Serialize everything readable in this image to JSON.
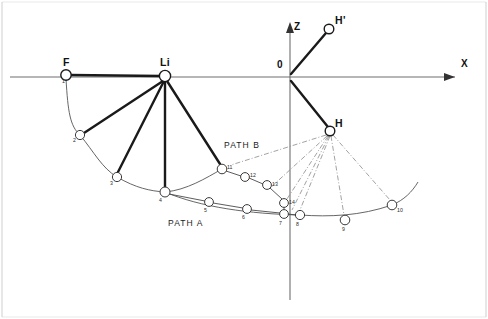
{
  "figure": {
    "background_color": "#ffffff",
    "width": 488,
    "height": 319
  },
  "axes": {
    "x_label": "X",
    "z_label": "Z",
    "origin_label": "0",
    "x_axis": {
      "y": 77,
      "x_start": 10,
      "x_end": 468
    },
    "z_axis": {
      "x": 290,
      "y_start": 22,
      "y_end": 300
    }
  },
  "atoms": [
    {
      "name": "F",
      "label": "F",
      "x": 66,
      "y": 75,
      "r": 5.2,
      "label_dx": -3,
      "label_dy": -18
    },
    {
      "name": "Li",
      "label": "Li",
      "x": 165,
      "y": 76,
      "r": 5.6,
      "label_dx": -5,
      "label_dy": -19
    },
    {
      "name": "H_prime",
      "label": "H'",
      "x": 329,
      "y": 29,
      "r": 4.8,
      "label_dx": 6,
      "label_dy": -14
    },
    {
      "name": "H",
      "label": "H",
      "x": 330,
      "y": 131,
      "r": 4.8,
      "label_dx": 5,
      "label_dy": -13
    }
  ],
  "bonds": [
    {
      "from": "F",
      "to": "Li",
      "style": "heavy"
    },
    {
      "from": "0",
      "to": "H_prime",
      "style": "heavy"
    },
    {
      "from": "0",
      "to": "H",
      "style": "heavy"
    }
  ],
  "li_rays": [
    {
      "to_point": 2
    },
    {
      "to_point": 3
    },
    {
      "to_point": 4
    },
    {
      "to_point": 11
    }
  ],
  "path_labels": [
    {
      "name": "path-a-label",
      "text": "PATH A",
      "x": 168,
      "y": 219
    },
    {
      "name": "path-b-label",
      "text": "PATH B",
      "x": 224,
      "y": 141
    }
  ],
  "trajectory_points": [
    {
      "id": 1,
      "label": "1",
      "x": 66,
      "y": 75,
      "r": 5.2,
      "path": "A",
      "label_dx": -4,
      "label_dy": 4
    },
    {
      "id": 2,
      "label": "2",
      "x": 80,
      "y": 135,
      "r": 4.6,
      "path": "A",
      "label_dx": -7,
      "label_dy": 3
    },
    {
      "id": 3,
      "label": "3",
      "x": 117,
      "y": 177,
      "r": 4.6,
      "path": "A",
      "label_dx": -7,
      "label_dy": 4
    },
    {
      "id": 4,
      "label": "4",
      "x": 165,
      "y": 192,
      "r": 5.0,
      "path": "A",
      "label_dx": -6,
      "label_dy": 6
    },
    {
      "id": 5,
      "label": "5",
      "x": 209,
      "y": 202,
      "r": 4.4,
      "path": "A",
      "label_dx": -5,
      "label_dy": 6
    },
    {
      "id": 6,
      "label": "6",
      "x": 247,
      "y": 209,
      "r": 4.4,
      "path": "A",
      "label_dx": -5,
      "label_dy": 6
    },
    {
      "id": 7,
      "label": "7",
      "x": 284,
      "y": 214,
      "r": 4.4,
      "path": "A",
      "label_dx": -5,
      "label_dy": 7
    },
    {
      "id": 8,
      "label": "8",
      "x": 300,
      "y": 215,
      "r": 4.6,
      "path": "A",
      "label_dx": -4,
      "label_dy": 7
    },
    {
      "id": 9,
      "label": "9",
      "x": 345,
      "y": 220,
      "r": 4.8,
      "path": "A",
      "label_dx": -3,
      "label_dy": 7
    },
    {
      "id": 10,
      "label": "10",
      "x": 392,
      "y": 205,
      "r": 4.8,
      "path": "A",
      "label_dx": 5,
      "label_dy": 3
    },
    {
      "id": 11,
      "label": "11",
      "x": 222,
      "y": 169,
      "r": 4.8,
      "path": "B",
      "label_dx": 5,
      "label_dy": -4
    },
    {
      "id": 12,
      "label": "12",
      "x": 245,
      "y": 177,
      "r": 4.4,
      "path": "B",
      "label_dx": 5,
      "label_dy": -4
    },
    {
      "id": 13,
      "label": "13",
      "x": 267,
      "y": 185,
      "r": 4.4,
      "path": "B",
      "label_dx": 5,
      "label_dy": -3
    },
    {
      "id": 14,
      "label": "14",
      "x": 284,
      "y": 203,
      "r": 4.4,
      "path": "B",
      "label_dx": 5,
      "label_dy": -3
    }
  ],
  "path_a_sequence": [
    4,
    5,
    6,
    7,
    8
  ],
  "path_b_sequence": [
    11,
    12,
    13,
    14,
    7
  ],
  "h_fan_targets": [
    7,
    8,
    9,
    10,
    13,
    14
  ],
  "arcs": {
    "inner_arc_points": [
      1,
      2,
      3,
      4,
      11
    ],
    "outer_arc_points": [
      4,
      8,
      9,
      10
    ]
  },
  "colors": {
    "line": "#1a1a1a",
    "axis": "#6e6e6e",
    "thin": "#555555",
    "dashdot": "#8a8a8a",
    "background": "#ffffff",
    "frame": "#cfcfcf"
  }
}
